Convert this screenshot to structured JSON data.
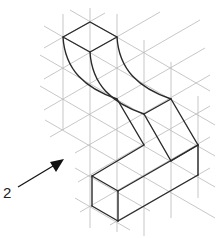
{
  "figure": {
    "type": "isometric sketch exercise",
    "view_label": "2",
    "arrow": {
      "direction": "view direction pointing toward object",
      "color": "#111111"
    },
    "grid_color": "#b9b9b9",
    "line_color": "#2a2a2a"
  }
}
